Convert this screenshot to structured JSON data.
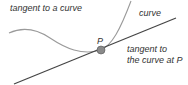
{
  "labels": {
    "tangent_curve": "tangent to a curve",
    "curve": "curve",
    "point": "P",
    "tangent_line_1": "tangent to",
    "tangent_line_2": "the curve at P"
  },
  "colors": {
    "curve": "#9a9a9a",
    "tangent": "#444444",
    "point_fill": "#8a8a8a",
    "point_stroke": "#555555"
  }
}
